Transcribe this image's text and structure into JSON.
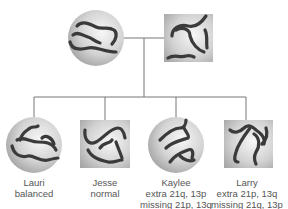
{
  "diagram": {
    "type": "pedigree-chart",
    "colors": {
      "line": "#777777",
      "chromosome": "#3a3a3a",
      "shape_light": "#f4f4f4",
      "shape_dark": "#a9a9a9",
      "label": "#555555"
    },
    "parents": [
      {
        "shape": "circle",
        "sex": "female"
      },
      {
        "shape": "square",
        "sex": "male"
      }
    ],
    "children": [
      {
        "name": "Lauri",
        "shape": "circle",
        "sex": "female",
        "lines": [
          "balanced"
        ]
      },
      {
        "name": "Jesse",
        "shape": "square",
        "sex": "male",
        "lines": [
          "normal"
        ]
      },
      {
        "name": "Kaylee",
        "shape": "circle",
        "sex": "female",
        "lines": [
          "extra 21q, 13p",
          "missing 21p, 13q"
        ]
      },
      {
        "name": "Larry",
        "shape": "square",
        "sex": "male",
        "lines": [
          "extra 21p, 13q",
          "missing 21q, 13p"
        ]
      }
    ]
  }
}
